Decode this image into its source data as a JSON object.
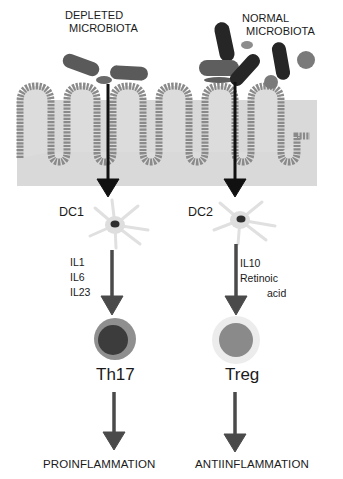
{
  "diagram": {
    "title_left": [
      "DEPLETED",
      "MICROBIOTA"
    ],
    "title_right": [
      "NORMAL",
      "MICROBIOTA"
    ],
    "dendritic_cells": {
      "left": "DC1",
      "right": "DC2"
    },
    "cytokines": {
      "left": [
        "IL1",
        "IL6",
        "IL23"
      ],
      "right": [
        "IL10",
        "Retinoic",
        "acid"
      ]
    },
    "t_cells": {
      "left": "Th17",
      "right": "Treg"
    },
    "outcomes": {
      "left": "PROINFLAMMATION",
      "right": "ANTIINFLAMMATION"
    },
    "colors": {
      "epithelium_bg": "#d9d9d9",
      "villus_border": "#8a8a8a",
      "bacteria_dark": "#2b2b2b",
      "bacteria_mid": "#5e5e5e",
      "bacteria_light": "#8c8c8c",
      "arrow": "#4a4a4a",
      "arrow_black": "#111111",
      "th17_outer": "#8f8f8f",
      "th17_inner": "#3c3c3c",
      "treg_outer": "#ececec",
      "treg_inner": "#8a8a8a",
      "dc_body": "#dedede",
      "dc_nucleus": "#2e2e2e"
    }
  }
}
